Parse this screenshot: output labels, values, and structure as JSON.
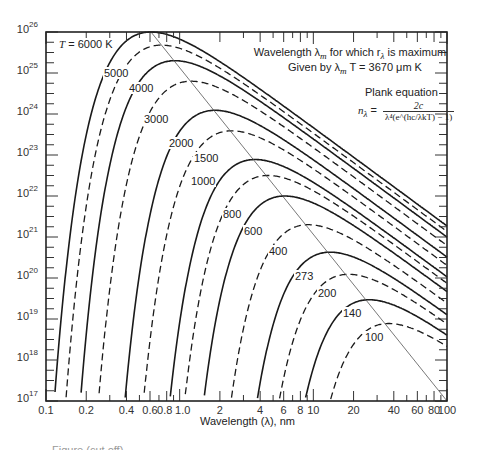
{
  "chart_data": {
    "type": "line",
    "title": "",
    "xlabel": "Wavelength (λ), nm",
    "ylabel": "",
    "xscale": "log",
    "yscale": "log",
    "xlim": [
      0.1,
      100
    ],
    "ylim": [
      1e+17,
      1e+26
    ],
    "grid": false,
    "x_ticks": [
      "0.1",
      "0.2",
      "0.4",
      "0.6",
      "0.8",
      "1.0",
      "2",
      "4",
      "6",
      "8",
      "10",
      "20",
      "40",
      "60",
      "80",
      "100"
    ],
    "x_tick_values": [
      0.1,
      0.2,
      0.4,
      0.6,
      0.8,
      1.0,
      2,
      4,
      6,
      8,
      10,
      20,
      40,
      60,
      80,
      100
    ],
    "y_ticks": [
      {
        "base": "10",
        "exp": "26",
        "value": 26
      },
      {
        "base": "10",
        "exp": "25",
        "value": 25
      },
      {
        "base": "10",
        "exp": "24",
        "value": 24
      },
      {
        "base": "10",
        "exp": "23",
        "value": 23
      },
      {
        "base": "10",
        "exp": "22",
        "value": 22
      },
      {
        "base": "10",
        "exp": "21",
        "value": 21
      },
      {
        "base": "10",
        "exp": "20",
        "value": 20
      },
      {
        "base": "10",
        "exp": "19",
        "value": 19
      },
      {
        "base": "10",
        "exp": "18",
        "value": 18
      },
      {
        "base": "10",
        "exp": "17",
        "value": 17
      }
    ],
    "annotations": {
      "line1": "Wavelength λ",
      "line1_sub": "m",
      "line1_rest": " for which r",
      "line1_sub2": "λ",
      "line1_end": " is maximum",
      "line2": "Given by λ",
      "line2_sub": "m",
      "line2_rest": " T = 3670 μm K",
      "equation_title": "Plank equation",
      "equation_lhs": "n",
      "equation_lhs_sub": "λ",
      "equation_num": "2c",
      "equation_den": "λ⁴(e^(hc/λkT) − 1)"
    },
    "peak_law": "λm·T = 3670",
    "series": [
      {
        "name": "T = 6000 K",
        "label": "T = 6000 K",
        "T": 6000,
        "style": "solid",
        "peak_lambda": 0.61,
        "peak_log": 26.0,
        "label_x": 58,
        "label_y": 44
      },
      {
        "name": "5000",
        "label": "5000",
        "T": 5000,
        "style": "dashed",
        "peak_lambda": 0.73,
        "peak_log": 25.68,
        "label_x": 103,
        "label_y": 73
      },
      {
        "name": "4000",
        "label": "4000",
        "T": 4000,
        "style": "solid",
        "peak_lambda": 0.92,
        "peak_log": 25.3,
        "label_x": 128,
        "label_y": 88
      },
      {
        "name": "3000",
        "label": "3000",
        "T": 3000,
        "style": "dashed",
        "peak_lambda": 1.22,
        "peak_log": 24.8,
        "label_x": 143,
        "label_y": 119
      },
      {
        "name": "2000",
        "label": "2000",
        "T": 2000,
        "style": "solid",
        "peak_lambda": 1.84,
        "peak_log": 24.09,
        "label_x": 168,
        "label_y": 143
      },
      {
        "name": "1500",
        "label": "1500",
        "T": 1500,
        "style": "dashed",
        "peak_lambda": 2.45,
        "peak_log": 23.59,
        "label_x": 193,
        "label_y": 158
      },
      {
        "name": "1000",
        "label": "1000",
        "T": 1000,
        "style": "solid",
        "peak_lambda": 3.67,
        "peak_log": 22.89,
        "label_x": 190,
        "label_y": 181
      },
      {
        "name": "800",
        "label": "800",
        "T": 800,
        "style": "dashed",
        "peak_lambda": 4.59,
        "peak_log": 22.5,
        "label_x": 222,
        "label_y": 214
      },
      {
        "name": "600",
        "label": "600",
        "T": 600,
        "style": "solid",
        "peak_lambda": 6.12,
        "peak_log": 22.0,
        "label_x": 243,
        "label_y": 231
      },
      {
        "name": "400",
        "label": "400",
        "T": 400,
        "style": "dashed",
        "peak_lambda": 9.18,
        "peak_log": 21.3,
        "label_x": 268,
        "label_y": 251
      },
      {
        "name": "273",
        "label": "273",
        "T": 273,
        "style": "solid",
        "peak_lambda": 13.4,
        "peak_log": 20.63,
        "label_x": 294,
        "label_y": 276
      },
      {
        "name": "200",
        "label": "200",
        "T": 200,
        "style": "dashed",
        "peak_lambda": 18.35,
        "peak_log": 20.09,
        "label_x": 317,
        "label_y": 293
      },
      {
        "name": "140",
        "label": "140",
        "T": 140,
        "style": "solid",
        "peak_lambda": 26.2,
        "peak_log": 19.47,
        "label_x": 342,
        "label_y": 313
      },
      {
        "name": "100",
        "label": "100",
        "T": 100,
        "style": "dashed",
        "peak_lambda": 36.7,
        "peak_log": 18.89,
        "label_x": 364,
        "label_y": 337
      }
    ],
    "peak_line": {
      "from": [
        0.61,
        26.0
      ],
      "to": [
        100,
        17.0
      ]
    }
  },
  "caption_partial": "Figure (cut off)",
  "colors": {
    "ink": "#222222",
    "line": "#1a1a1a",
    "thin": "#444444",
    "background": "#ffffff"
  }
}
